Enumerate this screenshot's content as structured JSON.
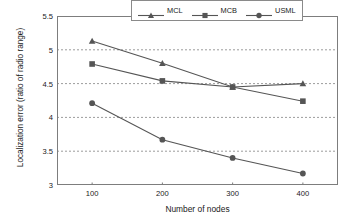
{
  "chart_data": {
    "type": "line",
    "title": "",
    "xlabel": "Number of nodes",
    "ylabel": "Localization error (ratio of radio range)",
    "x": [
      100,
      200,
      300,
      400
    ],
    "xtick_labels": [
      "100",
      "200",
      "300",
      "400"
    ],
    "ytick_labels": [
      "3",
      "3.5",
      "4",
      "4.5",
      "5",
      "5.5"
    ],
    "ytick_values": [
      3,
      3.5,
      4,
      4.5,
      5,
      5.5
    ],
    "ylim": [
      3,
      5.5
    ],
    "xlim": [
      50,
      450
    ],
    "grid": "horizontal-dashed",
    "gridlines": [
      3.5,
      4,
      4.5,
      5
    ],
    "legend_position": "top-right-inside",
    "line_color": "#555555",
    "grid_color": "#9c9c9c",
    "frame_color": "#7d7d7d",
    "series": [
      {
        "name": "MCL",
        "marker": "triangle",
        "values": [
          5.13,
          4.8,
          4.45,
          4.5
        ]
      },
      {
        "name": "MCB",
        "marker": "square",
        "values": [
          4.79,
          4.54,
          4.45,
          4.24
        ]
      },
      {
        "name": "USML",
        "marker": "circle",
        "values": [
          4.21,
          3.67,
          3.4,
          3.17
        ]
      }
    ]
  }
}
